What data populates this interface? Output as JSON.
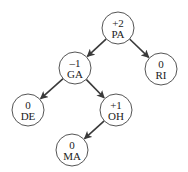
{
  "diagram": {
    "type": "avl-tree",
    "nodes": [
      {
        "id": "PA",
        "label": "PA",
        "balance": "+2",
        "cx": 118,
        "cy": 28
      },
      {
        "id": "GA",
        "label": "GA",
        "balance": "–1",
        "cx": 75,
        "cy": 68
      },
      {
        "id": "RI",
        "label": "RI",
        "balance": "0",
        "cx": 161,
        "cy": 69
      },
      {
        "id": "DE",
        "label": "DE",
        "balance": "0",
        "cx": 28,
        "cy": 110
      },
      {
        "id": "OH",
        "label": "OH",
        "balance": "+1",
        "cx": 116,
        "cy": 110
      },
      {
        "id": "MA",
        "label": "MA",
        "balance": "0",
        "cx": 72,
        "cy": 150
      }
    ],
    "edges": [
      {
        "from": "PA",
        "to": "GA"
      },
      {
        "from": "PA",
        "to": "RI"
      },
      {
        "from": "GA",
        "to": "DE"
      },
      {
        "from": "GA",
        "to": "OH"
      },
      {
        "from": "OH",
        "to": "MA"
      }
    ],
    "node_radius": 16,
    "colors": {
      "node_stroke": "#555555",
      "edge": "#3a3a3a",
      "text": "#222222",
      "background": "#ffffff"
    }
  }
}
